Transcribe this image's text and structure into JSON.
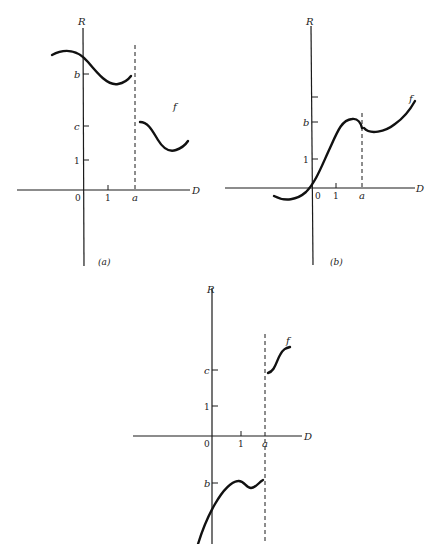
{
  "figure": {
    "panels": [
      {
        "id": "a",
        "caption": "(a)",
        "y_axis_label": "R",
        "x_axis_label": "D",
        "origin_label": "0",
        "x_ticks": [
          "1",
          "a"
        ],
        "y_ticks": [
          "1",
          "c",
          "b"
        ],
        "function_label": "f",
        "description": "Discontinuous at a: wave near b for x<a, jump down to c-region for x>a"
      },
      {
        "id": "b",
        "caption": "(b)",
        "y_axis_label": "R",
        "x_axis_label": "D",
        "origin_label": "0",
        "x_ticks": [
          "1",
          "a"
        ],
        "y_ticks": [
          "1",
          "b"
        ],
        "function_label": "f",
        "description": "Small jump at a near b, then increasing"
      },
      {
        "id": "c",
        "caption": "",
        "y_axis_label": "R",
        "x_axis_label": "D",
        "origin_label": "0",
        "x_ticks": [
          "1",
          "a"
        ],
        "y_ticks": [
          "1",
          "c",
          "b"
        ],
        "function_label": "f",
        "description": "Left of a approaches b (negative), right of a starts at c (positive)"
      }
    ]
  }
}
